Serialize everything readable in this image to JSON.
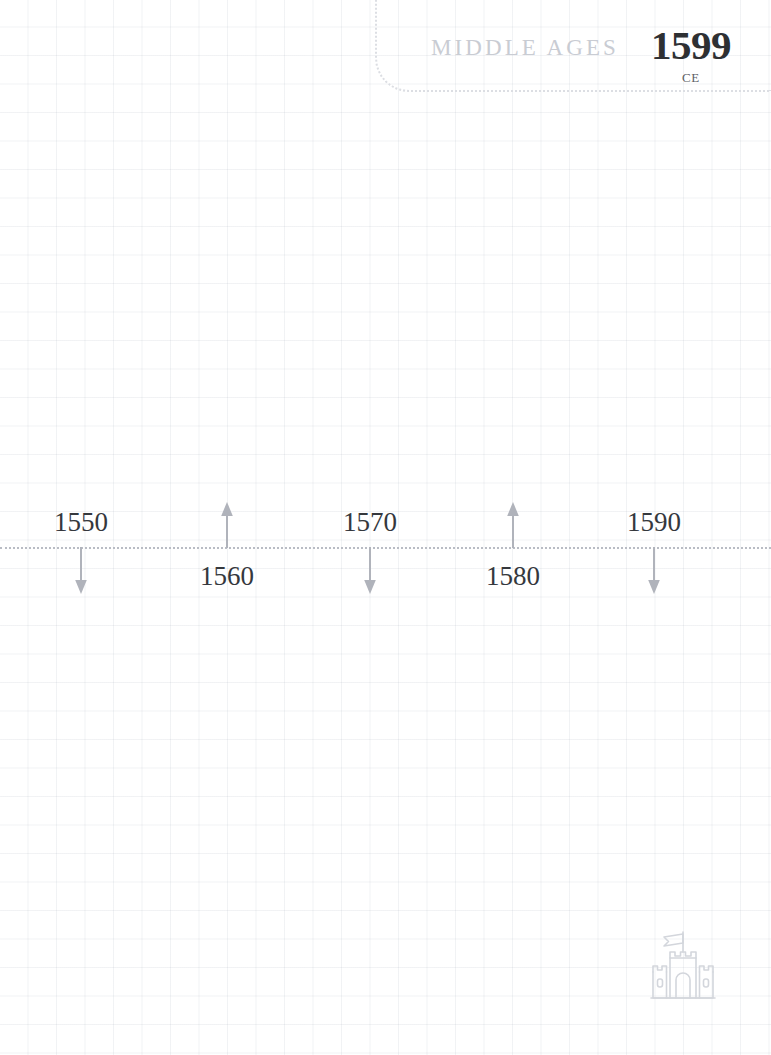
{
  "era_header": {
    "era_label": "MIDDLE AGES",
    "year": "1599",
    "era_suffix": "CE"
  },
  "timeline": {
    "axis_start_year": 1550,
    "axis_end_year": 1590,
    "ticks": [
      {
        "label": "1550",
        "x": 81,
        "position": "above",
        "arrow": "down"
      },
      {
        "label": "1560",
        "x": 227,
        "position": "below",
        "arrow": "up"
      },
      {
        "label": "1570",
        "x": 370,
        "position": "above",
        "arrow": "down"
      },
      {
        "label": "1580",
        "x": 513,
        "position": "below",
        "arrow": "up"
      },
      {
        "label": "1590",
        "x": 654,
        "position": "above",
        "arrow": "down"
      }
    ]
  },
  "emblem": {
    "icon": "castle-icon"
  },
  "colors": {
    "axis": "#b9bcc4",
    "tick_arrow": "#b0b3bb",
    "tick_label": "#35383d",
    "era_label": "#c9ccd3",
    "era_year": "#2e3033",
    "grid_line": "#aab2be",
    "emblem_outline": "#d3d6dc"
  }
}
